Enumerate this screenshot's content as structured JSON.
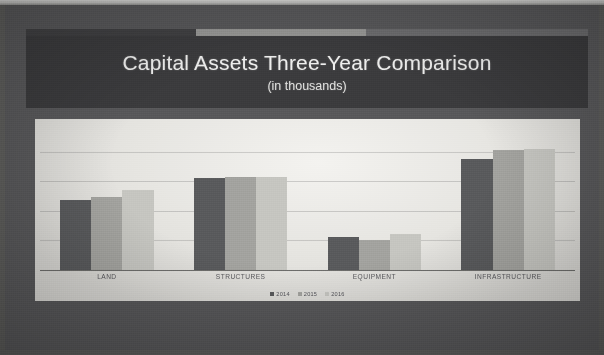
{
  "slide": {
    "title": "Capital Assets Three-Year Comparison",
    "subtitle": "(in thousands)",
    "banner_color": "#3b3b3d",
    "background_color": "#58585a",
    "panel_color": "#ecebe7"
  },
  "chart_data": {
    "type": "bar",
    "title": "Capital Assets Three-Year Comparison",
    "subtitle": "(in thousands)",
    "xlabel": "",
    "ylabel": "",
    "grid": true,
    "legend_position": "bottom",
    "ylim": [
      0,
      100
    ],
    "categories": [
      "LAND",
      "STRUCTURES",
      "EQUIPMENT",
      "INFRASTRUCTURE"
    ],
    "series": [
      {
        "name": "2014",
        "color": "#595a5c",
        "values": [
          47,
          62,
          22,
          75
        ]
      },
      {
        "name": "2015",
        "color": "#a3a39f",
        "values": [
          49,
          63,
          20,
          81
        ]
      },
      {
        "name": "2016",
        "color": "#c6c6c1",
        "values": [
          54,
          63,
          24,
          82
        ]
      }
    ]
  },
  "legend": {
    "items": [
      {
        "label": "2014",
        "color": "#595a5c"
      },
      {
        "label": "2015",
        "color": "#a3a39f"
      },
      {
        "label": "2016",
        "color": "#c6c6c1"
      }
    ]
  },
  "gridlines": [
    20,
    40,
    60,
    80
  ]
}
